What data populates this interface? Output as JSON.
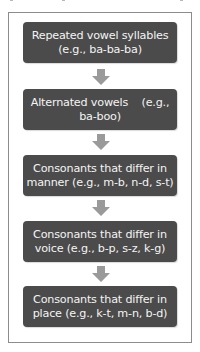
{
  "diagram": {
    "type": "vertical-flowchart",
    "steps": [
      {
        "line1": "Repeated vowel syllables",
        "line2": "(e.g., ba-ba-ba)"
      },
      {
        "line1": "Alternated vowels    (e.g.,",
        "line2": "ba-boo)"
      },
      {
        "line1": "Consonants that differ in",
        "line2": "manner (e.g., m-b, n-d, s-t)"
      },
      {
        "line1": "Consonants that differ in",
        "line2": "voice (e.g., b-p, s-z, k-g)"
      },
      {
        "line1": "Consonants that differ in",
        "line2": "place (e.g., k-t, m-n, b-d)"
      }
    ],
    "connector_icon": "down-arrow-icon",
    "colors": {
      "box_fill": "#4b4b4b",
      "box_text": "#f4f4f4",
      "arrow": "#9a9a9a",
      "frame_border": "#8c8c8c"
    }
  }
}
